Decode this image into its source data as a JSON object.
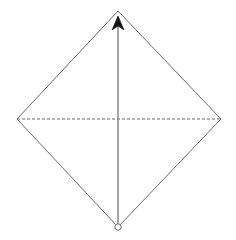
{
  "canvas": {
    "width": 236,
    "height": 240,
    "background_color": "#ffffff",
    "title": "Rhombus with vertical arrow axis and dashed horizontal diagonal"
  },
  "style": {
    "edge_color": "#6b6b6b",
    "edge_width": 1,
    "dashed_color": "#6b6b6b",
    "dashed_width": 1,
    "dash_pattern": "3 2",
    "arrow_line_color": "#808080",
    "arrow_line_width": 1.4,
    "arrow_head_color": "#111111",
    "vertex_marker_stroke": "#6b6b6b",
    "vertex_marker_fill": "#ffffff"
  },
  "shape": {
    "name": "rhombus",
    "vertices": [
      {
        "id": "top",
        "label": "top-vertex",
        "x": 118,
        "y": 11
      },
      {
        "id": "right",
        "label": "right-vertex",
        "x": 221,
        "y": 119
      },
      {
        "id": "bottom",
        "label": "bottom-vertex",
        "x": 118,
        "y": 227
      },
      {
        "id": "left",
        "label": "left-vertex",
        "x": 17,
        "y": 119
      }
    ],
    "outline_points": "118,11 221,119 118,227 17,119"
  },
  "diagonals": {
    "horizontal": {
      "label": "dashed-horizontal-diagonal",
      "style": "dashed",
      "x1": 17,
      "y1": 119,
      "x2": 221,
      "y2": 119
    },
    "vertical": {
      "label": "vertical-arrow-axis",
      "style": "solid-with-arrowhead",
      "direction": "up",
      "x1": 118,
      "y1": 227,
      "x2": 118,
      "y2": 17
    }
  },
  "arrow_head": {
    "label": "upward-arrowhead",
    "points": "118,16 112,30 118,26 124,30",
    "tip_x": 118,
    "tip_y": 16
  },
  "origin_marker": {
    "label": "origin-circle",
    "cx": 118,
    "cy": 227,
    "r": 3.2
  }
}
